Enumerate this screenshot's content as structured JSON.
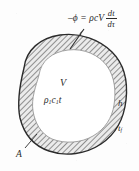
{
  "figure": {
    "background_color": "#fdfdfd",
    "ink_color": "#2b2b2b"
  },
  "equation": {
    "lead": "–ϕ = ρcV",
    "numerator": "dt",
    "denominator": "dτ",
    "full_text": "–ϕ = ρcV dt/dτ"
  },
  "labels": {
    "volume": "V",
    "capacity_symbol": "ρ",
    "capacity_sub_1": "1",
    "capacity_c": "c",
    "capacity_sub_2": "1",
    "capacity_t": "t",
    "heat_transfer_coefficient": "h",
    "fluid_temperature_symbol": "t",
    "fluid_temperature_sub": "f",
    "area": "A"
  },
  "shape": {
    "outline_color": "#2b2b2b",
    "hatch_color": "#6f6f6f",
    "shell_fill": "#e8e8e8",
    "core_fill": "#ffffff",
    "hatch_angle_deg": 45
  },
  "annotations": {
    "arrow_name": "flux-arrow",
    "leader_name": "area-leader-line"
  }
}
